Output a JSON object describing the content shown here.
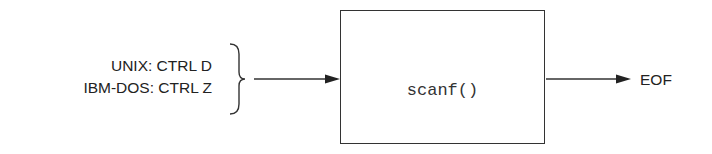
{
  "inputs": [
    {
      "label": "UNIX: CTRL D"
    },
    {
      "label": "IBM-DOS: CTRL Z"
    }
  ],
  "process": {
    "label": "scanf()"
  },
  "output": {
    "label": "EOF"
  },
  "colors": {
    "stroke": "#333333",
    "text": "#222222",
    "background": "#ffffff"
  }
}
